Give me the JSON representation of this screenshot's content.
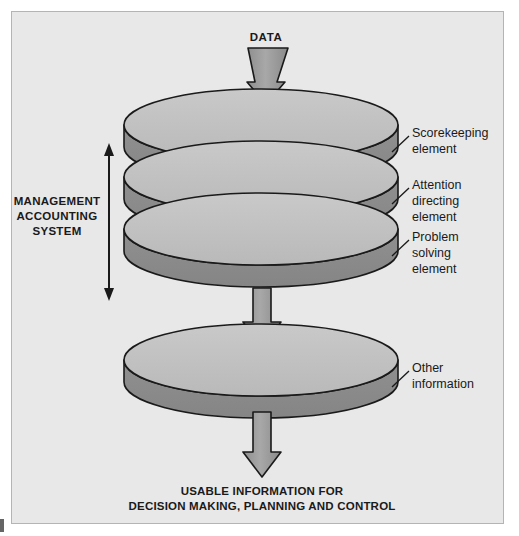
{
  "figure": {
    "background_color": "#ffffff",
    "panel_color": "#e8e8e8",
    "panel_border_color": "#b4b4b4",
    "ink_color": "#1a1a1a",
    "disc_top_color": "#bfbfbf",
    "disc_rim_color": "#8a8a8a",
    "arrow_fill_color": "#9a9a9a",
    "arrow_stroke_color": "#1a1a1a",
    "outline_color": "#1a1a1a"
  },
  "input": {
    "label": "DATA"
  },
  "bracket": {
    "line1": "MANAGEMENT",
    "line2": "ACCOUNTING",
    "line3": "SYSTEM"
  },
  "discs": [
    {
      "id": "scorekeeping",
      "label_line1": "Scorekeeping",
      "label_line2": "element",
      "label_line3": ""
    },
    {
      "id": "attention-directing",
      "label_line1": "Attention",
      "label_line2": "directing",
      "label_line3": "element"
    },
    {
      "id": "problem-solving",
      "label_line1": "Problem",
      "label_line2": "solving",
      "label_line3": "element"
    },
    {
      "id": "other-information",
      "label_line1": "Other",
      "label_line2": "information",
      "label_line3": ""
    }
  ],
  "output": {
    "line1": "USABLE INFORMATION FOR",
    "line2": "DECISION MAKING, PLANNING AND CONTROL"
  }
}
